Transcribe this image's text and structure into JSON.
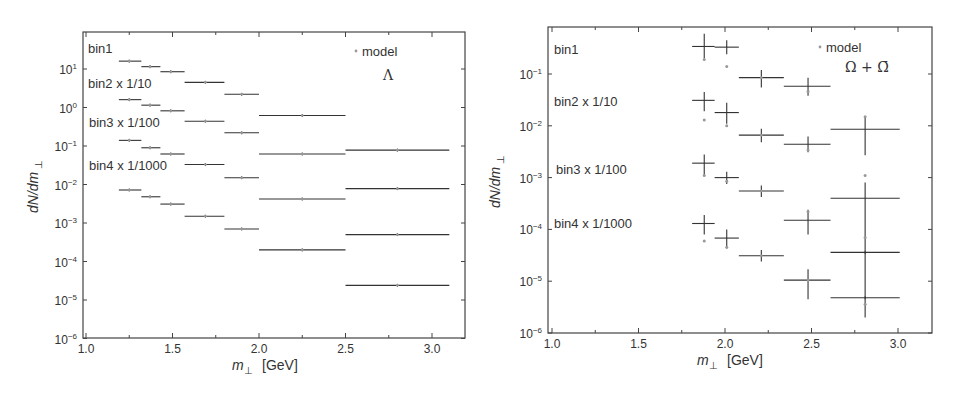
{
  "chart_data": [
    {
      "type": "scatter",
      "title": "",
      "species_label": "Λ",
      "legend": {
        "marker_label": "model",
        "marker_color": "#888888"
      },
      "xlabel": "m⊥ [GeV]",
      "ylabel": "dN/dm⊥",
      "yscale": "log",
      "xlim": [
        1.0,
        3.2
      ],
      "ylim": [
        1e-06,
        60
      ],
      "xticks": [
        "1.0",
        "1.5",
        "2.0",
        "2.5",
        "3.0"
      ],
      "yticks": [
        "10^1",
        "10^0",
        "10^-1",
        "10^-2",
        "10^-3",
        "10^-4",
        "10^-5",
        "10^-6"
      ],
      "grid": false,
      "series": [
        {
          "name": "bin1",
          "label": "bin1",
          "points": [
            {
              "x": 1.25,
              "xlo": 1.19,
              "xhi": 1.32,
              "y": 16.0
            },
            {
              "x": 1.37,
              "xlo": 1.32,
              "xhi": 1.43,
              "y": 11.5
            },
            {
              "x": 1.49,
              "xlo": 1.43,
              "xhi": 1.57,
              "y": 8.5
            },
            {
              "x": 1.69,
              "xlo": 1.57,
              "xhi": 1.8,
              "y": 4.5
            },
            {
              "x": 1.9,
              "xlo": 1.8,
              "xhi": 2.0,
              "y": 2.2
            }
          ]
        },
        {
          "name": "bin2 x 1/10",
          "label": "bin2 x 1/10",
          "points": [
            {
              "x": 1.25,
              "xlo": 1.19,
              "xhi": 1.32,
              "y": 1.6
            },
            {
              "x": 1.37,
              "xlo": 1.32,
              "xhi": 1.43,
              "y": 1.15
            },
            {
              "x": 1.49,
              "xlo": 1.43,
              "xhi": 1.57,
              "y": 0.82
            },
            {
              "x": 1.69,
              "xlo": 1.57,
              "xhi": 1.8,
              "y": 0.44
            },
            {
              "x": 1.9,
              "xlo": 1.8,
              "xhi": 2.0,
              "y": 0.22
            },
            {
              "x": 2.25,
              "xlo": 2.0,
              "xhi": 2.5,
              "y": 0.62
            }
          ]
        },
        {
          "name": "bin3 x 1/100",
          "label": "bin3 x 1/100",
          "points": [
            {
              "x": 1.25,
              "xlo": 1.19,
              "xhi": 1.32,
              "y": 0.14
            },
            {
              "x": 1.37,
              "xlo": 1.32,
              "xhi": 1.43,
              "y": 0.09
            },
            {
              "x": 1.49,
              "xlo": 1.43,
              "xhi": 1.57,
              "y": 0.062
            },
            {
              "x": 1.69,
              "xlo": 1.57,
              "xhi": 1.8,
              "y": 0.033
            },
            {
              "x": 1.9,
              "xlo": 1.8,
              "xhi": 2.0,
              "y": 0.015
            },
            {
              "x": 2.25,
              "xlo": 2.0,
              "xhi": 2.5,
              "y": 0.062
            },
            {
              "x": 2.8,
              "xlo": 2.5,
              "xhi": 3.1,
              "y": 0.078
            }
          ]
        },
        {
          "name": "bin4 x 1/1000",
          "label": "bin4 x 1/1000",
          "points": [
            {
              "x": 1.25,
              "xlo": 1.19,
              "xhi": 1.32,
              "y": 0.0072
            },
            {
              "x": 1.37,
              "xlo": 1.32,
              "xhi": 1.43,
              "y": 0.0048
            },
            {
              "x": 1.49,
              "xlo": 1.43,
              "xhi": 1.57,
              "y": 0.0031
            },
            {
              "x": 1.69,
              "xlo": 1.57,
              "xhi": 1.8,
              "y": 0.0015
            },
            {
              "x": 1.9,
              "xlo": 1.8,
              "xhi": 2.0,
              "y": 0.0007
            },
            {
              "x": 2.25,
              "xlo": 2.0,
              "xhi": 2.5,
              "y": 0.0042
            },
            {
              "x": 2.8,
              "xlo": 2.5,
              "xhi": 3.1,
              "y": 0.0078
            },
            {
              "x": 2.25,
              "xlo": 2.0,
              "xhi": 2.5,
              "y": 0.0002
            },
            {
              "x": 2.8,
              "xlo": 2.5,
              "xhi": 3.1,
              "y": 0.0005
            },
            {
              "x": 2.8,
              "xlo": 2.5,
              "xhi": 3.1,
              "y": 2.4e-05
            }
          ]
        }
      ]
    },
    {
      "type": "scatter",
      "title": "",
      "species_label": "Ω + Ω̄",
      "legend": {
        "marker_label": "model",
        "marker_color": "#888888"
      },
      "xlabel": "m⊥ [GeV]",
      "ylabel": "dN/dm⊥",
      "yscale": "log",
      "xlim": [
        1.0,
        3.2
      ],
      "ylim": [
        1e-06,
        0.9
      ],
      "xticks": [
        "1.0",
        "1.5",
        "2.0",
        "2.5",
        "3.0"
      ],
      "yticks": [
        "10^-1",
        "10^-2",
        "10^-3",
        "10^-4",
        "10^-5",
        "10^-6"
      ],
      "grid": false,
      "series": [
        {
          "name": "bin1",
          "label": "bin1",
          "points": [
            {
              "x": 1.88,
              "xlo": 1.81,
              "xhi": 1.94,
              "y": 0.34,
              "ylo": 0.2,
              "yhi": 0.6,
              "model": 0.19
            },
            {
              "x": 2.01,
              "xlo": 1.94,
              "xhi": 2.08,
              "y": 0.33,
              "ylo": 0.24,
              "yhi": 0.45,
              "model": 0.14
            },
            {
              "x": 2.21,
              "xlo": 2.08,
              "xhi": 2.34,
              "y": 0.085,
              "ylo": 0.055,
              "yhi": 0.12
            },
            {
              "x": 2.48,
              "xlo": 2.34,
              "xhi": 2.61,
              "y": 0.058,
              "ylo": 0.038,
              "yhi": 0.085,
              "model": 0.046
            }
          ]
        },
        {
          "name": "bin2 x 1/10",
          "label": "bin2 x 1/10",
          "points": [
            {
              "x": 1.88,
              "xlo": 1.81,
              "xhi": 1.94,
              "y": 0.031,
              "ylo": 0.019,
              "yhi": 0.045,
              "model": 0.013
            },
            {
              "x": 2.01,
              "xlo": 1.94,
              "xhi": 2.08,
              "y": 0.018,
              "ylo": 0.011,
              "yhi": 0.028,
              "model": 0.01
            },
            {
              "x": 2.21,
              "xlo": 2.08,
              "xhi": 2.34,
              "y": 0.0066,
              "ylo": 0.0048,
              "yhi": 0.0088
            },
            {
              "x": 2.48,
              "xlo": 2.34,
              "xhi": 2.61,
              "y": 0.0044,
              "ylo": 0.0031,
              "yhi": 0.0062,
              "model": 0.0034
            },
            {
              "x": 2.81,
              "xlo": 2.61,
              "xhi": 3.01,
              "y": 0.0086,
              "ylo": 0.0027,
              "yhi": 0.015,
              "model": 0.015
            }
          ]
        },
        {
          "name": "bin3 x 1/100",
          "label": "bin3 x 1/100",
          "points": [
            {
              "x": 1.88,
              "xlo": 1.81,
              "xhi": 1.94,
              "y": 0.0019,
              "ylo": 0.0011,
              "yhi": 0.0028,
              "model": 0.0011
            },
            {
              "x": 2.01,
              "xlo": 1.94,
              "xhi": 2.08,
              "y": 0.001,
              "ylo": 0.00075,
              "yhi": 0.0013,
              "model": 0.00085
            },
            {
              "x": 2.21,
              "xlo": 2.08,
              "xhi": 2.34,
              "y": 0.00055,
              "ylo": 0.00042,
              "yhi": 0.0007
            },
            {
              "x": 2.48,
              "xlo": 2.34,
              "xhi": 2.61,
              "y": 0.00015,
              "ylo": 8e-05,
              "yhi": 0.00024,
              "model": 0.00022
            },
            {
              "x": 2.81,
              "xlo": 2.61,
              "xhi": 3.01,
              "y": 0.0004,
              "ylo": 2e-06,
              "yhi": 0.0008,
              "model": 0.0011
            }
          ]
        },
        {
          "name": "bin4 x 1/1000",
          "label": "bin4 x 1/1000",
          "points": [
            {
              "x": 1.88,
              "xlo": 1.81,
              "xhi": 1.94,
              "y": 0.00013,
              "ylo": 8e-05,
              "yhi": 0.00019,
              "model": 6e-05
            },
            {
              "x": 2.01,
              "xlo": 1.94,
              "xhi": 2.08,
              "y": 6.8e-05,
              "ylo": 4.3e-05,
              "yhi": 0.0001,
              "model": 4.5e-05
            },
            {
              "x": 2.21,
              "xlo": 2.08,
              "xhi": 2.34,
              "y": 3.1e-05,
              "ylo": 2.4e-05,
              "yhi": 4e-05
            },
            {
              "x": 2.48,
              "xlo": 2.34,
              "xhi": 2.61,
              "y": 1.05e-05,
              "ylo": 4.5e-06,
              "yhi": 1.7e-05
            },
            {
              "x": 2.81,
              "xlo": 2.61,
              "xhi": 3.01,
              "y": 3.6e-05,
              "model": 7e-05
            },
            {
              "x": 2.81,
              "xlo": 2.61,
              "xhi": 3.01,
              "y": 4.8e-06,
              "model": 3.6e-06
            }
          ]
        }
      ]
    }
  ],
  "panels": [
    {
      "id": "lambda",
      "species": "Λ",
      "legend_model": "model",
      "xlabel_main": "m",
      "xlabel_sub": "⊥",
      "xlabel_unit": "[GeV]",
      "ylabel_main": "dN/dm",
      "ylabel_sub": "⊥",
      "bin_labels": [
        "bin1",
        "bin2 x 1/10",
        "bin3 x 1/100",
        "bin4 x 1/1000"
      ]
    },
    {
      "id": "omega",
      "species": "Ω + Ω̄",
      "legend_model": "model",
      "xlabel_main": "m",
      "xlabel_sub": "⊥",
      "xlabel_unit": "[GeV]",
      "ylabel_main": "dN/dm",
      "ylabel_sub": "⊥",
      "bin_labels": [
        "bin1",
        "bin2 x 1/10",
        "bin3 x 1/100",
        "bin4 x 1/1000"
      ]
    }
  ],
  "colors": {
    "axis": "#444444",
    "data": "#333333",
    "model": "#999999"
  }
}
